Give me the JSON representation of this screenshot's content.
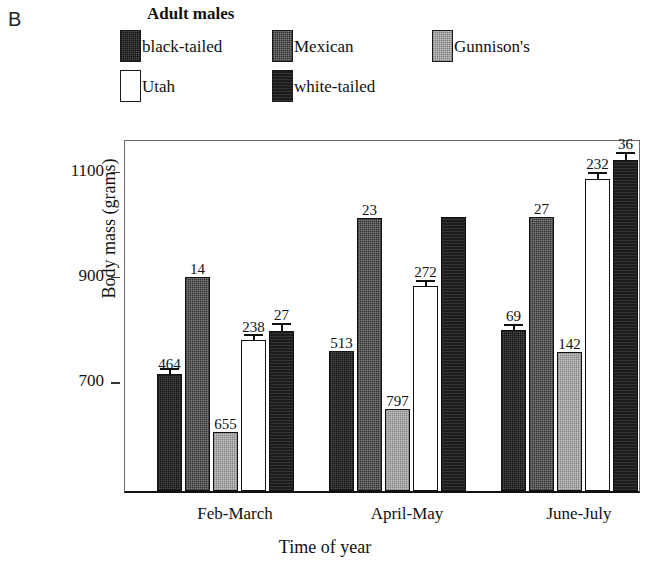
{
  "panel": {
    "letter": "B"
  },
  "legend": {
    "title": "Adult males",
    "items": [
      {
        "label": "black-tailed",
        "key": "blacktailed",
        "color": "#4a4a4a"
      },
      {
        "label": "Mexican",
        "key": "mexican",
        "color": "#7d7d7d"
      },
      {
        "label": "Gunnison's",
        "key": "gunnisons",
        "color": "#c2c2c2"
      },
      {
        "label": "Utah",
        "key": "utah",
        "color": "#ffffff"
      },
      {
        "label": "white-tailed",
        "key": "whitetailed",
        "color": "#1c1c1c"
      }
    ]
  },
  "axes": {
    "ylabel": "Body mass (grams)",
    "xlabel": "Time of year",
    "yticks": [
      "700",
      "900",
      "1100"
    ]
  },
  "chart_data": {
    "type": "bar",
    "title": "Adult males",
    "xlabel": "Time of year",
    "ylabel": "Body mass (grams)",
    "ylim": [
      490,
      1160
    ],
    "yticks": [
      700,
      900,
      1100
    ],
    "grid": false,
    "legend_position": "top",
    "categories": [
      "Feb-March",
      "April-May",
      "June-July"
    ],
    "series": [
      {
        "name": "black-tailed",
        "color": "#4a4a4a",
        "values": [
          712,
          755,
          795
        ],
        "errors": [
          4,
          0,
          12
        ],
        "n_labels": [
          "464",
          "513",
          "69"
        ]
      },
      {
        "name": "Mexican",
        "color": "#7d7d7d",
        "values": [
          896,
          1008,
          1010
        ],
        "errors": [
          0,
          0,
          0
        ],
        "n_labels": [
          "14",
          "23",
          "27"
        ]
      },
      {
        "name": "Gunnison's",
        "color": "#c2c2c2",
        "values": [
          602,
          645,
          753
        ],
        "errors": [
          0,
          0,
          0
        ],
        "n_labels": [
          "655",
          "797",
          "142"
        ]
      },
      {
        "name": "Utah",
        "color": "#ffffff",
        "values": [
          777,
          880,
          1083
        ],
        "errors": [
          10,
          10,
          12
        ],
        "n_labels": [
          "238",
          "272",
          "232"
        ]
      },
      {
        "name": "white-tailed",
        "color": "#1c1c1c",
        "values": [
          793,
          1010,
          1118
        ],
        "errors": [
          16,
          0,
          16
        ],
        "n_labels": [
          "27",
          "",
          "36"
        ]
      }
    ],
    "annotation_note": "Numbers above bars are sample sizes (n)"
  }
}
